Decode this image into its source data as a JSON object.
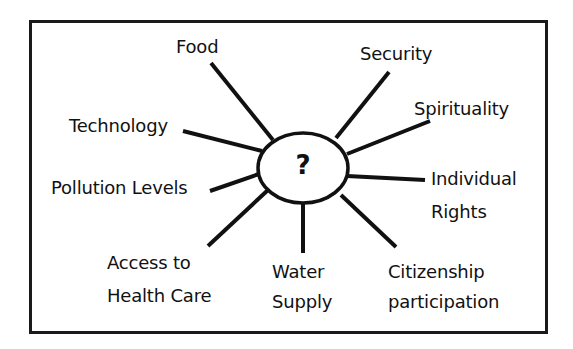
{
  "diagram": {
    "type": "mind-map",
    "center": {
      "label": "?",
      "shape": "ellipse",
      "cx": 303,
      "cy": 168,
      "rx": 45,
      "ry": 35
    },
    "colors": {
      "line": "#111111",
      "text": "#111111",
      "background": "#ffffff",
      "frame": "#1a1a1a"
    },
    "branches": [
      {
        "id": "food",
        "lines": [
          "Food"
        ],
        "x": 176,
        "y": 36,
        "spoke": [
          211,
          63,
          273,
          140
        ]
      },
      {
        "id": "security",
        "lines": [
          "Security"
        ],
        "x": 360,
        "y": 43,
        "spoke": [
          389,
          72,
          336,
          138
        ]
      },
      {
        "id": "spirituality",
        "lines": [
          "Spirituality"
        ],
        "x": 414,
        "y": 98,
        "spoke": [
          430,
          121,
          347,
          154
        ]
      },
      {
        "id": "technology",
        "lines": [
          "Technology"
        ],
        "x": 69,
        "y": 115,
        "spoke": [
          183,
          131,
          262,
          151
        ]
      },
      {
        "id": "individual-rights",
        "lines": [
          "Individual",
          "Rights"
        ],
        "x": 431,
        "y": 162,
        "line_height": 33,
        "spoke": [
          347,
          176,
          425,
          180
        ]
      },
      {
        "id": "pollution-levels",
        "lines": [
          "Pollution Levels"
        ],
        "x": 51,
        "y": 177,
        "spoke": [
          210,
          191,
          259,
          174
        ]
      },
      {
        "id": "access-to-health-care",
        "lines": [
          "Access to",
          "Health Care"
        ],
        "x": 107,
        "y": 246,
        "line_height": 33,
        "spoke": [
          208,
          246,
          268,
          190
        ]
      },
      {
        "id": "water-supply",
        "lines": [
          "Water",
          "Supply"
        ],
        "x": 272,
        "y": 257,
        "line_height": 30,
        "spoke": [
          303,
          202,
          303,
          253
        ]
      },
      {
        "id": "citizenship-participation",
        "lines": [
          "Citizenship",
          "participation"
        ],
        "x": 388,
        "y": 257,
        "line_height": 30,
        "spoke": [
          341,
          195,
          396,
          247
        ]
      }
    ]
  }
}
